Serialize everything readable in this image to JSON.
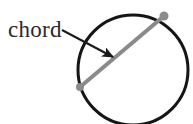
{
  "figure": {
    "type": "geometry-diagram",
    "background_color": "#ffffff",
    "label": {
      "text": "chord",
      "color": "#2a2a2a",
      "x": 8,
      "y": 17
    },
    "circle": {
      "name": "circle-outline",
      "center_x": 133,
      "center_y": 70,
      "radius": 55,
      "stroke_color": "#151515",
      "stroke_width": 3,
      "fill": "none"
    },
    "chord": {
      "name": "chord-segment",
      "x1": 80,
      "y1": 87,
      "x2": 164,
      "y2": 16,
      "stroke_color": "#8a8a8a",
      "stroke_width": 4
    },
    "endpoints": [
      {
        "name": "chord-endpoint-lower-left",
        "cx": 80,
        "cy": 87,
        "r": 4,
        "color": "#8a8a8a"
      },
      {
        "name": "chord-endpoint-upper-right",
        "cx": 164,
        "cy": 16,
        "r": 4.5,
        "color": "#8a8a8a"
      }
    ],
    "arrow": {
      "name": "chord-pointer-arrow",
      "x1": 62,
      "y1": 30,
      "x2": 116,
      "y2": 59,
      "stroke_color": "#1a1a1a",
      "stroke_width": 2,
      "head_size": 9
    }
  }
}
